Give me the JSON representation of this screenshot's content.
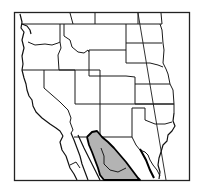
{
  "map": {
    "title": "",
    "region": "Western United States and northern Mexico",
    "colors": {
      "background": "#ffffff",
      "frame": "#222222",
      "borders": "#1a1a1a",
      "range_fill": "#b3b3b3",
      "range_outline": "#000000"
    },
    "layers": [
      {
        "name": "state-borders",
        "type": "line"
      },
      {
        "name": "coastline",
        "type": "line"
      },
      {
        "name": "longitude-meridian",
        "type": "line"
      },
      {
        "name": "species-range",
        "type": "polygon",
        "fill": "#b3b3b3"
      }
    ],
    "labels": []
  }
}
